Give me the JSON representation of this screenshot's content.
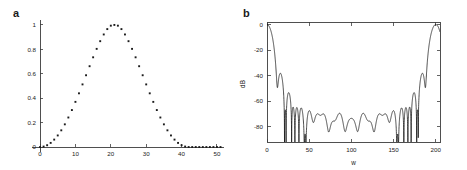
{
  "figure": {
    "background_color": "#ffffff",
    "ink_color": "#1b1b1b",
    "axis_color": "#3c3c3c",
    "width": 467,
    "height": 170
  },
  "panels": {
    "a": {
      "label": "a"
    },
    "b": {
      "label": "b"
    }
  },
  "chart_data": [
    {
      "type": "scatter",
      "panel": "a",
      "title": "a",
      "xlabel": "",
      "ylabel": "",
      "xlim": [
        0,
        52
      ],
      "ylim": [
        0,
        1.04
      ],
      "grid": false,
      "legend": null,
      "xticks": [
        0,
        10,
        20,
        30,
        40,
        50
      ],
      "xticklabels": [
        "0",
        "10",
        "20",
        "30",
        "40",
        "50"
      ],
      "yticks": [
        0,
        0.2,
        0.4,
        0.6,
        0.8,
        1
      ],
      "yticklabels": [
        "0",
        "0.2",
        "0.4",
        "0.6",
        "0.8",
        "1"
      ],
      "marker": "square-dot",
      "series": [
        {
          "name": "window coefficients",
          "x": [
            0,
            1,
            2,
            3,
            4,
            5,
            6,
            7,
            8,
            9,
            10,
            11,
            12,
            13,
            14,
            15,
            16,
            17,
            18,
            19,
            20,
            21,
            22,
            23,
            24,
            25,
            26,
            27,
            28,
            29,
            30,
            31,
            32,
            33,
            34,
            35,
            36,
            37,
            38,
            39,
            40,
            41,
            42,
            43,
            44,
            45,
            46,
            47,
            48,
            49,
            50,
            51
          ],
          "values": [
            0.0,
            0.004,
            0.015,
            0.034,
            0.061,
            0.095,
            0.137,
            0.186,
            0.242,
            0.303,
            0.37,
            0.44,
            0.513,
            0.588,
            0.662,
            0.735,
            0.804,
            0.867,
            0.922,
            0.966,
            0.994,
            1.0,
            0.994,
            0.966,
            0.922,
            0.867,
            0.804,
            0.735,
            0.662,
            0.588,
            0.513,
            0.44,
            0.37,
            0.303,
            0.242,
            0.186,
            0.137,
            0.095,
            0.061,
            0.034,
            0.015,
            0.004,
            0.0,
            0.0,
            0.0,
            0.0,
            0.0,
            0.0,
            0.0,
            0.0,
            0.0,
            0.0
          ]
        }
      ]
    },
    {
      "type": "line",
      "panel": "b",
      "title": "b",
      "xlabel": "w",
      "ylabel": "dB",
      "xlim": [
        0,
        205
      ],
      "ylim": [
        -92,
        2
      ],
      "grid": false,
      "legend": null,
      "xticks": [
        0,
        50,
        100,
        150,
        200
      ],
      "xticklabels": [
        "0",
        "50",
        "100",
        "150",
        "200"
      ],
      "yticks": [
        0,
        -20,
        -40,
        -60,
        -80
      ],
      "yticklabels": [
        "0",
        "-20",
        "-40",
        "-60",
        "-80"
      ],
      "description": "Magnitude frequency response in dB with narrow main lobes at both edges and a dense oscillating sidelobe floor near -80 dB across the middle.",
      "series": [
        {
          "name": "magnitude response",
          "mainlobe_edges": [
            0,
            200
          ],
          "mainlobe_peak_db": 0,
          "sidelobe_floor_db": -85,
          "sidelobe_ripple_db": 10
        }
      ]
    }
  ]
}
